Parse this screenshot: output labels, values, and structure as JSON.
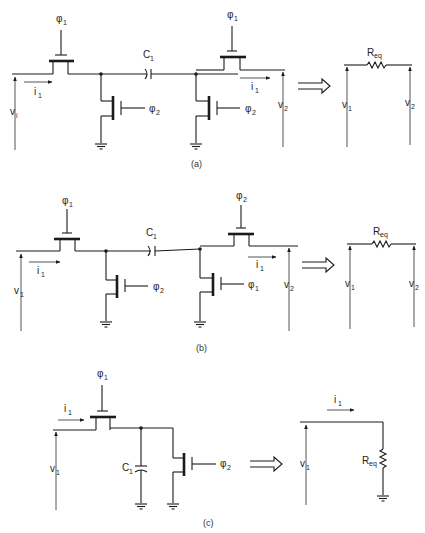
{
  "figure": {
    "panels": [
      {
        "id": "a",
        "caption": "(a)",
        "labels": {
          "phi_top_left": "φ",
          "phi_top_left_sub": "1",
          "phi_top_right": "φ",
          "phi_top_right_sub": "1",
          "phi_shunt_left": "φ",
          "phi_shunt_left_sub": "2",
          "phi_shunt_right": "φ",
          "phi_shunt_right_sub": "2",
          "cap": "C",
          "cap_sub": "1",
          "i_in": "i",
          "i_in_sub": "1",
          "i_out": "i",
          "i_out_sub": "1",
          "v_in": "v",
          "v_in_sub": "i",
          "v_out": "v",
          "v_out_sub": "2",
          "eq_r": "R",
          "eq_r_sub": "eq",
          "eq_v1": "v",
          "eq_v1_sub": "1",
          "eq_v2": "v",
          "eq_v2_sub": "2"
        }
      },
      {
        "id": "b",
        "caption": "(b)",
        "labels": {
          "phi_top_left": "φ",
          "phi_top_left_sub": "1",
          "phi_top_right": "φ",
          "phi_top_right_sub": "2",
          "phi_shunt_left": "φ",
          "phi_shunt_left_sub": "2",
          "phi_shunt_right": "φ",
          "phi_shunt_right_sub": "1",
          "cap": "C",
          "cap_sub": "1",
          "i_in": "i",
          "i_in_sub": "1",
          "i_out": "i",
          "i_out_sub": "1",
          "v_in": "v",
          "v_in_sub": "1",
          "v_out": "v",
          "v_out_sub": "2",
          "eq_r": "R",
          "eq_r_sub": "eq",
          "eq_v1": "v",
          "eq_v1_sub": "1",
          "eq_v2": "v",
          "eq_v2_sub": "2"
        }
      },
      {
        "id": "c",
        "caption": "(c)",
        "labels": {
          "phi_top": "φ",
          "phi_top_sub": "1",
          "phi_shunt": "φ",
          "phi_shunt_sub": "2",
          "cap": "C",
          "cap_sub": "1",
          "i_in": "i",
          "i_in_sub": "1",
          "v_in": "v",
          "v_in_sub": "1",
          "eq_i": "i",
          "eq_i_sub": "1",
          "eq_v1": "v",
          "eq_v1_sub": "1",
          "eq_r": "R",
          "eq_r_sub": "eq"
        }
      }
    ],
    "equivalence_arrow": "⟹",
    "colors": {
      "ink": "#1a1a1a",
      "background": "#ffffff"
    }
  }
}
